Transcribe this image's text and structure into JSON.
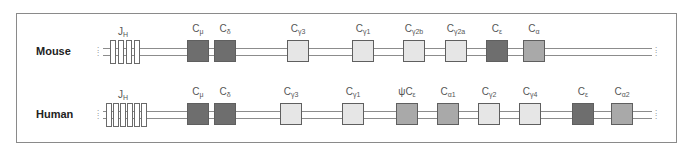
{
  "diagram": {
    "title": "",
    "colors": {
      "dark": "#6e6e6e",
      "medium": "#a9a9a9",
      "light": "#e6e6e6",
      "line": "#8c8c8c",
      "frame": "#8a8a8a"
    },
    "rows": [
      {
        "species": "Mouse",
        "jh_label": "J",
        "jh_sub": "H",
        "jh_segments": 4,
        "genes": [
          {
            "name": "C",
            "sub": "μ",
            "shade": "dark"
          },
          {
            "name": "C",
            "sub": "δ",
            "shade": "dark"
          },
          {
            "name": "C",
            "sub": "γ3",
            "shade": "light"
          },
          {
            "name": "C",
            "sub": "γ1",
            "shade": "light"
          },
          {
            "name": "C",
            "sub": "γ2b",
            "shade": "light"
          },
          {
            "name": "C",
            "sub": "γ2a",
            "shade": "light"
          },
          {
            "name": "C",
            "sub": "ε",
            "shade": "dark"
          },
          {
            "name": "C",
            "sub": "α",
            "shade": "medium"
          }
        ]
      },
      {
        "species": "Human",
        "jh_label": "J",
        "jh_sub": "H",
        "jh_segments": 6,
        "genes": [
          {
            "name": "C",
            "sub": "μ",
            "shade": "dark"
          },
          {
            "name": "C",
            "sub": "δ",
            "shade": "dark"
          },
          {
            "name": "C",
            "sub": "γ3",
            "shade": "light"
          },
          {
            "name": "C",
            "sub": "γ1",
            "shade": "light"
          },
          {
            "name": "ψC",
            "sub": "ε",
            "shade": "medium"
          },
          {
            "name": "C",
            "sub": "α1",
            "shade": "medium"
          },
          {
            "name": "C",
            "sub": "γ2",
            "shade": "light"
          },
          {
            "name": "C",
            "sub": "γ4",
            "shade": "light"
          },
          {
            "name": "C",
            "sub": "ε",
            "shade": "dark"
          },
          {
            "name": "C",
            "sub": "α2",
            "shade": "medium"
          }
        ]
      }
    ]
  }
}
